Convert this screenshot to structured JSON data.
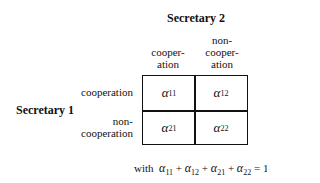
{
  "column_player": {
    "label": "Secretary 2"
  },
  "row_player": {
    "label": "Secretary 1"
  },
  "columns": [
    {
      "line1": "",
      "line2": "cooper-",
      "line3": "ation"
    },
    {
      "line1": "non-",
      "line2": "cooper-",
      "line3": "ation"
    }
  ],
  "rows": [
    {
      "line1": "",
      "line2": "cooperation"
    },
    {
      "line1": "non-",
      "line2": "cooperation"
    }
  ],
  "cells": [
    [
      {
        "symbol": "α",
        "sub": "11"
      },
      {
        "symbol": "α",
        "sub": "12"
      }
    ],
    [
      {
        "symbol": "α",
        "sub": "21"
      },
      {
        "symbol": "α",
        "sub": "22"
      }
    ]
  ],
  "constraint": {
    "prefix": "with",
    "terms": [
      {
        "symbol": "α",
        "sub": "11"
      },
      {
        "symbol": "α",
        "sub": "12"
      },
      {
        "symbol": "α",
        "sub": "21"
      },
      {
        "symbol": "α",
        "sub": "22"
      }
    ],
    "operator": "+",
    "equals": "= 1"
  }
}
